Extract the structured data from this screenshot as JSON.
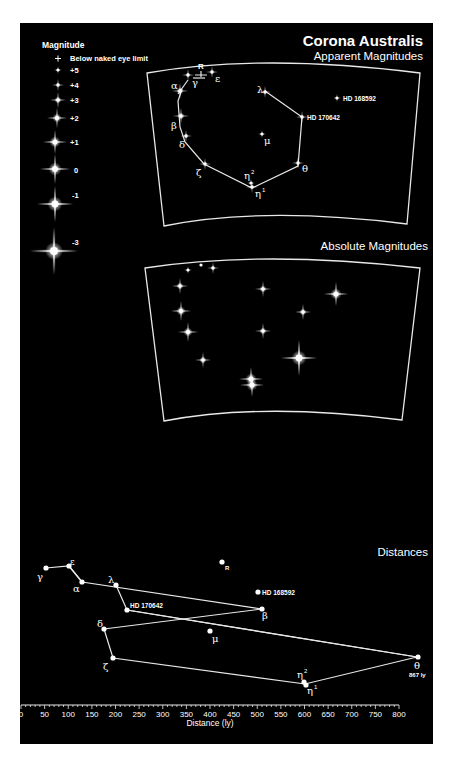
{
  "title": "Corona Australis",
  "legend": {
    "heading": "Magnitude",
    "items": [
      {
        "label": "Below naked eye limit",
        "symbol": "plus"
      },
      {
        "label": "+5"
      },
      {
        "label": "+4"
      },
      {
        "label": "+3"
      },
      {
        "label": "+2"
      },
      {
        "label": "+1"
      },
      {
        "label": "0"
      },
      {
        "label": "-1"
      },
      {
        "label": "-3"
      }
    ]
  },
  "panels": {
    "apparent": {
      "title": "Apparent Magnitudes"
    },
    "absolute": {
      "title": "Absolute Magnitudes"
    },
    "distances": {
      "title": "Distances"
    }
  },
  "star_labels": {
    "R": "R",
    "alpha": "α",
    "beta": "β",
    "gamma": "γ",
    "delta": "δ",
    "epsilon": "ε",
    "zeta": "ζ",
    "eta1": "η",
    "eta2": "η",
    "theta": "θ",
    "lambda": "λ",
    "mu": "μ",
    "hd168592": "HD 168592",
    "hd170642": "HD 170642",
    "theta_dist": "867 ly"
  },
  "axis": {
    "label": "Distance (ly)",
    "ticks": [
      "0",
      "50",
      "100",
      "150",
      "200",
      "250",
      "300",
      "350",
      "400",
      "450",
      "500",
      "550",
      "600",
      "650",
      "700",
      "750",
      "800"
    ]
  },
  "chart_data": {
    "type": "scatter",
    "title": "Corona Australis",
    "subtitle": "Distances",
    "xlabel": "Distance (ly)",
    "xlim": [
      0,
      800
    ],
    "stars": [
      {
        "name": "γ",
        "distance_ly": 55
      },
      {
        "name": "ε",
        "distance_ly": 100
      },
      {
        "name": "α",
        "distance_ly": 125
      },
      {
        "name": "λ",
        "distance_ly": 200
      },
      {
        "name": "HD 170642",
        "distance_ly": 220
      },
      {
        "name": "δ",
        "distance_ly": 175
      },
      {
        "name": "ζ",
        "distance_ly": 190
      },
      {
        "name": "μ",
        "distance_ly": 395
      },
      {
        "name": "R",
        "distance_ly": 420
      },
      {
        "name": "HD 168592",
        "distance_ly": 500
      },
      {
        "name": "β",
        "distance_ly": 495
      },
      {
        "name": "η²",
        "distance_ly": 600
      },
      {
        "name": "η¹",
        "distance_ly": 605
      },
      {
        "name": "θ",
        "distance_ly": 867
      }
    ],
    "legend_magnitudes": [
      "Below naked eye limit",
      "+5",
      "+4",
      "+3",
      "+2",
      "+1",
      "0",
      "-1",
      "-3"
    ]
  }
}
